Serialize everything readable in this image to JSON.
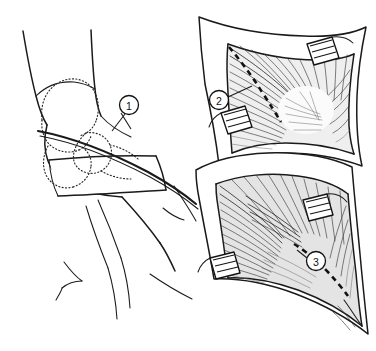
{
  "figure": {
    "background_color": "#ffffff",
    "ink_color": "#1a1a1a",
    "width": 376,
    "height": 351
  },
  "panels": [
    {
      "id": "panel-1",
      "name": "patient-position-panel",
      "description": "Lateral view of patient with dotted pelvis and femur outline and planned skin incision"
    },
    {
      "id": "panel-2",
      "name": "superficial-exposure-panel",
      "description": "Exposed muscle belly through retracted wound with dashed muscle-splitting line"
    },
    {
      "id": "panel-3",
      "name": "deep-exposure-panel",
      "description": "Deeper dissection through retracted wound with dashed capsular incision line"
    }
  ],
  "callouts": [
    {
      "id": 1,
      "label": "1",
      "cx": 129,
      "cy": 105,
      "r": 9.5,
      "panel": "panel-1",
      "points_to": "skin incision line"
    },
    {
      "id": 2,
      "label": "2",
      "cx": 219,
      "cy": 100,
      "r": 9.5,
      "panel": "panel-2",
      "points_to": "muscle splitting line"
    },
    {
      "id": 3,
      "label": "3",
      "cx": 316,
      "cy": 261,
      "r": 9.5,
      "panel": "panel-3",
      "points_to": "deep dashed incision line"
    }
  ],
  "annotations": {
    "dashed_line_style": "interrupted black dashes marking the intended line of incision",
    "retractor_count": 4,
    "retractor_name": "self-retaining retractor blade"
  }
}
